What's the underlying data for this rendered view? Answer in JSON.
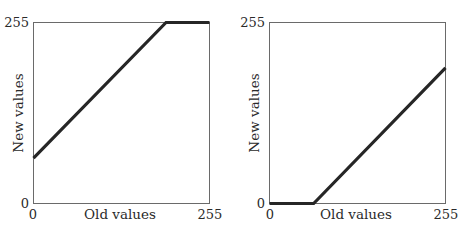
{
  "chart_data": [
    {
      "type": "line",
      "title": "",
      "xlabel": "Old values",
      "ylabel": "New values",
      "xlim": [
        0,
        255
      ],
      "ylim": [
        0,
        255
      ],
      "xticks": [
        "0",
        "255"
      ],
      "yticks": [
        "0",
        "255"
      ],
      "grid": false,
      "series": [
        {
          "name": "mapping",
          "x": [
            0,
            192,
            255
          ],
          "y": [
            64,
            255,
            255
          ]
        }
      ]
    },
    {
      "type": "line",
      "title": "",
      "xlabel": "Old values",
      "ylabel": "New values",
      "xlim": [
        0,
        255
      ],
      "ylim": [
        0,
        255
      ],
      "xticks": [
        "0",
        "255"
      ],
      "yticks": [
        "0",
        "255"
      ],
      "grid": false,
      "series": [
        {
          "name": "mapping",
          "x": [
            0,
            64,
            255
          ],
          "y": [
            0,
            0,
            191
          ]
        }
      ]
    }
  ]
}
